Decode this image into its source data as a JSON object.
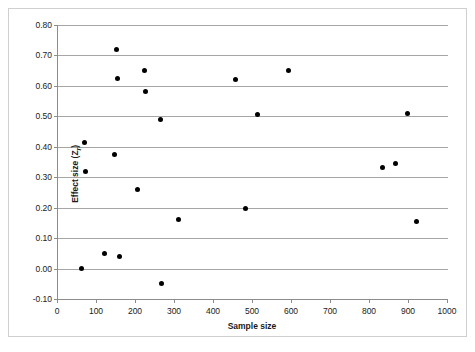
{
  "chart_data": {
    "type": "scatter",
    "title": "",
    "xlabel": "Sample size",
    "ylabel": "Effect size (Zr)",
    "ylabel_main": "Effect size (Z",
    "ylabel_sub": "r",
    "ylabel_tail": ")",
    "xlim": [
      0,
      1000
    ],
    "ylim": [
      -0.1,
      0.8
    ],
    "xticks": [
      0,
      100,
      200,
      300,
      400,
      500,
      600,
      700,
      800,
      900,
      1000
    ],
    "xtick_labels": [
      "0",
      "100",
      "200",
      "300",
      "400",
      "500",
      "600",
      "700",
      "800",
      "900",
      "1000"
    ],
    "yticks": [
      -0.1,
      0.0,
      0.1,
      0.2,
      0.3,
      0.4,
      0.5,
      0.6,
      0.7,
      0.8
    ],
    "ytick_labels": [
      "-0.10",
      "0.00",
      "0.10",
      "0.20",
      "0.30",
      "0.40",
      "0.50",
      "0.60",
      "0.70",
      "0.80"
    ],
    "grid": "horizontal",
    "legend": "none",
    "marker": "filled-circle",
    "marker_color": "#000000",
    "grid_color": "#a6a6a6",
    "points": [
      {
        "x": 60,
        "y": 0.0
      },
      {
        "x": 68,
        "y": 0.415
      },
      {
        "x": 70,
        "y": 0.32
      },
      {
        "x": 120,
        "y": 0.05
      },
      {
        "x": 145,
        "y": 0.375
      },
      {
        "x": 150,
        "y": 0.72
      },
      {
        "x": 152,
        "y": 0.625
      },
      {
        "x": 158,
        "y": 0.04
      },
      {
        "x": 205,
        "y": 0.26
      },
      {
        "x": 222,
        "y": 0.65
      },
      {
        "x": 225,
        "y": 0.58
      },
      {
        "x": 262,
        "y": 0.49
      },
      {
        "x": 265,
        "y": -0.05
      },
      {
        "x": 310,
        "y": 0.16
      },
      {
        "x": 455,
        "y": 0.62
      },
      {
        "x": 480,
        "y": 0.197
      },
      {
        "x": 512,
        "y": 0.505
      },
      {
        "x": 590,
        "y": 0.65
      },
      {
        "x": 832,
        "y": 0.333
      },
      {
        "x": 865,
        "y": 0.345
      },
      {
        "x": 897,
        "y": 0.51
      },
      {
        "x": 920,
        "y": 0.155
      }
    ]
  }
}
